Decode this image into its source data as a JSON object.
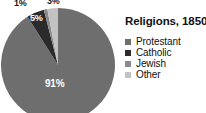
{
  "chart_data": {
    "type": "pie",
    "title": "Religions, 1850",
    "categories": [
      "Protestant",
      "Catholic",
      "Jewish",
      "Other"
    ],
    "values": [
      91,
      5,
      1,
      3
    ],
    "value_labels": [
      "91%",
      "5%",
      "1%",
      "3%"
    ],
    "colors": [
      "#6e6e6e",
      "#2b2b2b",
      "#8a8a8a",
      "#c2c2c2"
    ],
    "legend_position": "right",
    "grid": false,
    "start_angle_deg": 0,
    "direction": "counterclockwise"
  },
  "figure": {
    "title": "Religions, 1850",
    "background": "#ffffff"
  },
  "pie": {
    "labels": {
      "protestant": "91%",
      "catholic": "5%",
      "jewish": "1%",
      "other": "3%"
    },
    "geometry": {
      "cx": 58,
      "cy": 65,
      "r": 57
    }
  },
  "legend": {
    "items": [
      {
        "label": "Protestant",
        "color": "#6e6e6e",
        "value": "91%"
      },
      {
        "label": "Catholic",
        "color": "#2b2b2b",
        "value": "5%"
      },
      {
        "label": "Jewish",
        "color": "#8a8a8a",
        "value": "1%"
      },
      {
        "label": "Other",
        "color": "#c2c2c2",
        "value": "3%"
      }
    ]
  }
}
